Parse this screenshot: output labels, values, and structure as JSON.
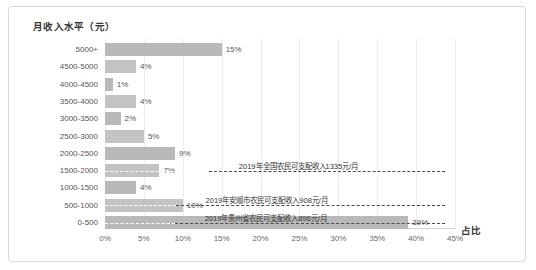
{
  "chart_data": {
    "type": "bar",
    "orientation": "horizontal",
    "title": "月收入水平（元）",
    "xlabel": "占比",
    "ylabel": "",
    "categories": [
      "5000+",
      "4500-5000",
      "4000-4500",
      "3500-4000",
      "3000-3500",
      "2500-3000",
      "2000-2500",
      "1500-2000",
      "1000-1500",
      "500-1000",
      "0-500"
    ],
    "values": [
      15,
      4,
      1,
      4,
      2,
      5,
      9,
      7,
      4,
      10,
      39
    ],
    "value_labels": [
      "15%",
      "4%",
      "1%",
      "4%",
      "2%",
      "5%",
      "9%",
      "7%",
      "4%",
      "10%",
      "39%"
    ],
    "xticks": [
      "0%",
      "5%",
      "10%",
      "15%",
      "20%",
      "25%",
      "30%",
      "35%",
      "40%",
      "45%"
    ],
    "xlim": [
      0,
      45
    ],
    "grid": true,
    "legend": "none",
    "annotations": [
      {
        "text": "2019年全国农民可支配收入1335元/月",
        "value": 13.35
      },
      {
        "text": "2019年安顺市农民可支配收入908元/月",
        "value": 9.08
      },
      {
        "text": "2019年贵州省农民可支配收入896元/月",
        "value": 8.96
      }
    ],
    "colors": {
      "bar": "#b9b9b9",
      "grid": "#ececec",
      "annotation_line": "#4a4a4a",
      "text": "#555555"
    }
  }
}
